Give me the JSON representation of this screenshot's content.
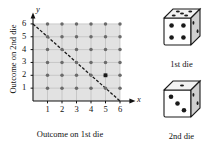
{
  "chart_data": {
    "type": "scatter",
    "title": "",
    "xlabel": "Outcome on 1st die",
    "ylabel": "Outcome on 2nd die",
    "x_axis_symbol": "x",
    "y_axis_symbol": "y",
    "xticks": [
      1,
      2,
      3,
      4,
      5,
      6
    ],
    "yticks": [
      1,
      2,
      3,
      4,
      5,
      6
    ],
    "xlim": [
      0,
      7
    ],
    "ylim": [
      0,
      7
    ],
    "grid": true,
    "legend": "none",
    "shaded_region": {
      "description": "light gray rectangle covering the sample space 0-6.6 in x and 0-6.6 in y",
      "color": "#e2e2e2"
    },
    "points": [
      {
        "x": 1,
        "y": 1
      },
      {
        "x": 2,
        "y": 1
      },
      {
        "x": 3,
        "y": 1
      },
      {
        "x": 4,
        "y": 1
      },
      {
        "x": 5,
        "y": 1
      },
      {
        "x": 6,
        "y": 1
      },
      {
        "x": 1,
        "y": 2
      },
      {
        "x": 2,
        "y": 2
      },
      {
        "x": 3,
        "y": 2
      },
      {
        "x": 4,
        "y": 2
      },
      {
        "x": 5,
        "y": 2
      },
      {
        "x": 6,
        "y": 2
      },
      {
        "x": 1,
        "y": 3
      },
      {
        "x": 2,
        "y": 3
      },
      {
        "x": 3,
        "y": 3
      },
      {
        "x": 4,
        "y": 3
      },
      {
        "x": 5,
        "y": 3
      },
      {
        "x": 6,
        "y": 3
      },
      {
        "x": 1,
        "y": 4
      },
      {
        "x": 2,
        "y": 4
      },
      {
        "x": 3,
        "y": 4
      },
      {
        "x": 4,
        "y": 4
      },
      {
        "x": 5,
        "y": 4
      },
      {
        "x": 6,
        "y": 4
      },
      {
        "x": 1,
        "y": 5
      },
      {
        "x": 2,
        "y": 5
      },
      {
        "x": 3,
        "y": 5
      },
      {
        "x": 4,
        "y": 5
      },
      {
        "x": 5,
        "y": 5
      },
      {
        "x": 6,
        "y": 5
      },
      {
        "x": 1,
        "y": 6
      },
      {
        "x": 2,
        "y": 6
      },
      {
        "x": 3,
        "y": 6
      },
      {
        "x": 4,
        "y": 6
      },
      {
        "x": 5,
        "y": 6
      },
      {
        "x": 6,
        "y": 6
      }
    ],
    "point_count": 36,
    "point_color": "#6b6b6b",
    "highlighted_point": {
      "x": 5,
      "y": 2,
      "color": "#1a1a1a",
      "marker": "square"
    },
    "dashed_line": {
      "from": [
        0,
        6
      ],
      "to": [
        6,
        0
      ],
      "equation": "x + y = 6",
      "style": "dashed",
      "color": "#1a1a1a"
    }
  },
  "axes": {
    "x_symbol": "x",
    "y_symbol": "y",
    "x_title": "Outcome on 1st die",
    "y_title": "Outcome on 2nd die",
    "x_ticks": [
      "1",
      "2",
      "3",
      "4",
      "5",
      "6"
    ],
    "y_ticks": [
      "1",
      "2",
      "3",
      "4",
      "5",
      "6"
    ]
  },
  "dice": [
    {
      "caption": "1st die",
      "front_pips": 4,
      "top_pips": 5,
      "right_pips": 2,
      "icon": "die-cube-icon"
    },
    {
      "caption": "2nd die",
      "front_pips": 3,
      "top_pips": 1,
      "right_pips": 2,
      "icon": "die-cube-icon"
    }
  ],
  "colors": {
    "shade": "#e2e2e2",
    "grid": "#b5b5b5",
    "axis": "#111111",
    "dot": "#6b6b6b",
    "dot_highlight": "#1a1a1a",
    "die_face": "#ffffff",
    "die_side": "#cfcfcf",
    "die_top": "#f2f2f2",
    "die_outline": "#1a1a1a",
    "pip": "#1a1a1a"
  }
}
